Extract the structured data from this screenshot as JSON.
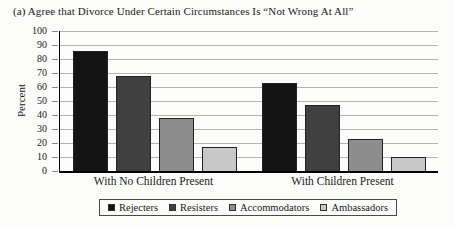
{
  "title": "(a) Agree that Divorce Under Certain Circumstances Is “Not Wrong At All”",
  "chart_data": {
    "type": "bar",
    "title": "(a) Agree that Divorce Under Certain Circumstances Is “Not Wrong At All”",
    "categories": [
      "With No Children Present",
      "With Children Present"
    ],
    "series": [
      {
        "name": "Rejecters",
        "values": [
          86,
          63
        ],
        "color": "#141414"
      },
      {
        "name": "Resisters",
        "values": [
          68,
          47
        ],
        "color": "#404040"
      },
      {
        "name": "Accommodators",
        "values": [
          38,
          23
        ],
        "color": "#8d8d8d"
      },
      {
        "name": "Ambassadors",
        "values": [
          17,
          10
        ],
        "color": "#c8c8c8"
      }
    ],
    "xlabel": "",
    "ylabel": "Percent",
    "ylim": [
      0,
      100
    ],
    "yticks": [
      0,
      10,
      20,
      30,
      40,
      50,
      60,
      70,
      80,
      90,
      100
    ],
    "grid": true,
    "legend_position": "bottom-boxed"
  },
  "colors": {
    "background": "#fcfcfb",
    "gridline": "#b4b4b4",
    "axis": "#000000",
    "text": "#1a1a1a",
    "bar_border": "#222222",
    "legend_border": "#4a4a4a"
  }
}
